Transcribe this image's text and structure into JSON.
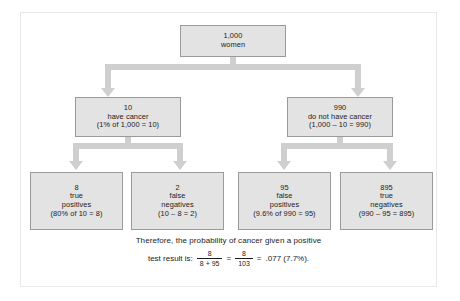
{
  "diagram": {
    "type": "probability-tree",
    "title_present": false,
    "colors": {
      "box_fill": "#e3e3e3",
      "box_border": "#9a9a9a",
      "arrow": "#cfcfcf",
      "text": "#1b1b1b",
      "frame": "#e8e8e8",
      "background": "#ffffff"
    },
    "nodes": {
      "root": {
        "lines": [
          "1,000",
          "women"
        ],
        "count": "1,000",
        "label": "women"
      },
      "cancer": {
        "lines": [
          "10",
          "have cancer",
          "(1% of 1,000 = 10)"
        ],
        "count": "10",
        "label": "have cancer",
        "calc": "(1% of 1,000 = 10)"
      },
      "no_cancer": {
        "lines": [
          "990",
          "do not have cancer",
          "(1,000 – 10 = 990)"
        ],
        "count": "990",
        "label": "do not have cancer",
        "calc": "(1,000 – 10 = 990)"
      },
      "true_positives": {
        "lines": [
          "8",
          "true",
          "positives",
          "(80% of 10 = 8)"
        ],
        "count": "8",
        "label_line1": "true",
        "label_line2": "positives",
        "calc": "(80% of 10 = 8)"
      },
      "false_negatives": {
        "lines": [
          "2",
          "false",
          "negatives",
          "(10 – 8 = 2)"
        ],
        "count": "2",
        "label_line1": "false",
        "label_line2": "negatives",
        "calc": "(10 – 8 = 2)"
      },
      "false_positives": {
        "lines": [
          "95",
          "false",
          "positives",
          "(9.6% of 990 = 95)"
        ],
        "count": "95",
        "label_line1": "false",
        "label_line2": "positives",
        "calc": "(9.6% of 990 = 95)"
      },
      "true_negatives": {
        "lines": [
          "895",
          "true",
          "negatives",
          "(990 – 95 = 895)"
        ],
        "count": "895",
        "label_line1": "true",
        "label_line2": "negatives",
        "calc": "(990 – 95 = 895)"
      }
    },
    "caption": {
      "line1": "Therefore, the probability of cancer given a positive",
      "line2_prefix": "test result is:",
      "fraction1": {
        "numerator": "8",
        "denominator": "8 + 95"
      },
      "operator1": "=",
      "fraction2": {
        "numerator": "8",
        "denominator": "103"
      },
      "operator2": "=",
      "result": ".077 (7.7%)."
    }
  }
}
